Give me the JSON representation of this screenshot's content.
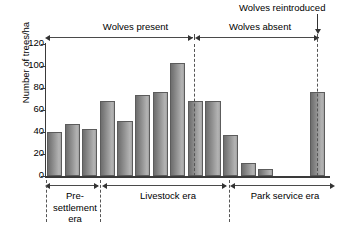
{
  "chart_data": {
    "type": "bar",
    "title": "",
    "xlabel": "",
    "ylabel": "Number of trees/ha",
    "ylim": [
      0,
      120
    ],
    "yticks": [
      0,
      20,
      40,
      60,
      80,
      100,
      120
    ],
    "grid": false,
    "legend": "none",
    "categories": [
      "1",
      "2",
      "3",
      "4",
      "5",
      "6",
      "7",
      "8",
      "9",
      "10",
      "11",
      "12",
      "13",
      "14"
    ],
    "values": [
      40,
      47,
      43,
      68,
      50,
      74,
      76,
      103,
      68,
      68,
      37,
      12,
      6,
      76
    ],
    "annotations": {
      "top_brackets": [
        {
          "label": "Wolves present",
          "start_bar": 1,
          "end_bar": 8
        },
        {
          "label": "Wolves absent",
          "start_bar": 9,
          "end_bar": 14
        }
      ],
      "bottom_brackets": [
        {
          "label": "Pre-\nsettlement\nera",
          "start_bar": 1,
          "end_bar": 3
        },
        {
          "label": "Livestock era",
          "start_bar": 4,
          "end_bar": 10
        },
        {
          "label": "Park service era",
          "start_bar": 11,
          "end_bar": 14
        }
      ],
      "event_marker": {
        "label": "Wolves reintroduced",
        "at_bar": 14
      }
    }
  },
  "axis": {
    "y_label": "Number of trees/ha",
    "y_tick_labels": [
      "120",
      "100",
      "80",
      "60",
      "40",
      "20",
      "0"
    ]
  },
  "top_annotations": {
    "wolves_present": "Wolves present",
    "wolves_absent": "Wolves absent",
    "wolves_reintroduced": "Wolves reintroduced"
  },
  "bottom_annotations": {
    "pre_settlement": "Pre-\nsettlement\nera",
    "livestock": "Livestock era",
    "park_service": "Park service era"
  },
  "colors": {
    "bar_dark": "#6e6e6e",
    "bar_light": "#b4b4b4",
    "bar_border": "#5c5c5c",
    "axis": "#3a3a3a",
    "dashed": "#555555",
    "background": "#ffffff"
  }
}
